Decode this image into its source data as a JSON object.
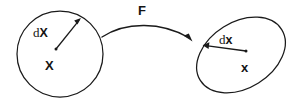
{
  "figure": {
    "background_color": "#ffffff",
    "stroke_color": "#1a1a1a",
    "labels": {
      "mapping": "F",
      "reference_differential_d": "d",
      "reference_differential_vector": "X",
      "reference_position": "X",
      "current_differential_d": "d",
      "current_differential_vector": "x",
      "current_position": "x"
    },
    "shapes": {
      "reference_body": {
        "name": "circle",
        "cx": 60,
        "cy": 54,
        "rx": 43,
        "ry": 43
      },
      "current_body": {
        "name": "tilted-ellipse",
        "cx": 241,
        "cy": 55,
        "rx": 48,
        "ry": 33,
        "rotation_deg": -32
      },
      "reference_vector_arrow": {
        "from_x": 56,
        "from_y": 49,
        "to_x": 80,
        "to_y": 19
      },
      "current_vector_arrow": {
        "from_x": 246,
        "from_y": 51,
        "to_x": 204,
        "to_y": 45
      },
      "mapping_arrow": {
        "from_x": 102,
        "from_y": 37,
        "to_x": 192,
        "to_y": 42,
        "curved": true
      }
    }
  }
}
